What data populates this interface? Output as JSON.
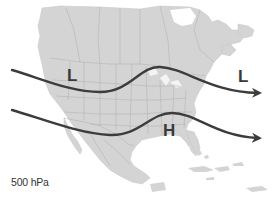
{
  "map": {
    "title": "500 hPa",
    "region": "North America",
    "colors": {
      "land": "#d4d4d4",
      "border": "#aaaaaa",
      "water": "#ffffff",
      "arrow": "#3c3c3c",
      "label": "#3a3a3a"
    },
    "pressure_labels": [
      {
        "id": "low-west",
        "text": "L",
        "type": "low"
      },
      {
        "id": "low-east",
        "text": "L",
        "type": "low"
      },
      {
        "id": "high-south",
        "text": "H",
        "type": "high"
      }
    ],
    "flow_arrows": [
      {
        "id": "northern-jet",
        "direction": "west-to-east"
      },
      {
        "id": "southern-jet",
        "direction": "west-to-east"
      }
    ]
  }
}
